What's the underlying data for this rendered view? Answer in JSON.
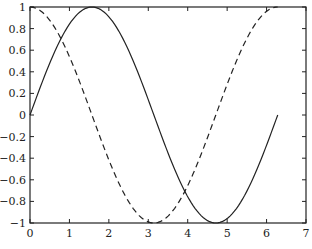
{
  "chart_data": {
    "type": "line",
    "title": "",
    "xlabel": "",
    "ylabel": "",
    "xlim": [
      0,
      7
    ],
    "ylim": [
      -1,
      1
    ],
    "grid": false,
    "legend": null,
    "xticks": [
      "0",
      "1",
      "2",
      "3",
      "4",
      "5",
      "6",
      "7"
    ],
    "yticks": [
      "1",
      "0.8",
      "0.6",
      "0.4",
      "0.2",
      "0",
      "-0.2",
      "-0.4",
      "-0.6",
      "-0.8",
      "-1"
    ],
    "x_range": [
      0,
      6.2832
    ],
    "series": [
      {
        "name": "sin(x)",
        "style": "solid",
        "function": "sin",
        "x": [
          0,
          0.785,
          1.571,
          2.356,
          3.142,
          3.927,
          4.712,
          5.498,
          6.283
        ],
        "values": [
          0,
          0.707,
          1,
          0.707,
          0,
          -0.707,
          -1,
          -0.707,
          0
        ]
      },
      {
        "name": "cos(x)",
        "style": "dashed",
        "function": "cos",
        "x": [
          0,
          0.785,
          1.571,
          2.356,
          3.142,
          3.927,
          4.712,
          5.498,
          6.283
        ],
        "values": [
          1,
          0.707,
          0,
          -0.707,
          -1,
          -0.707,
          0,
          0.707,
          1
        ]
      }
    ]
  },
  "colors": {
    "line": "#222222",
    "axis": "#222222",
    "background": "#ffffff"
  }
}
